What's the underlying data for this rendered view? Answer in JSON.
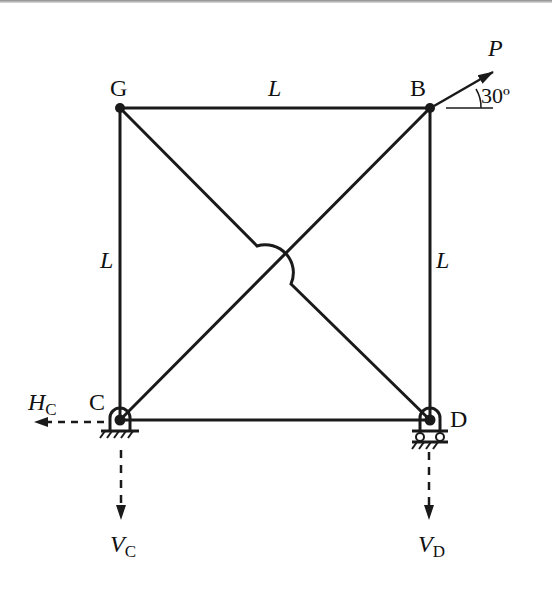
{
  "diagram": {
    "type": "truss / frame structure",
    "nodes": {
      "G": {
        "label": "G",
        "x": 120,
        "y": 108
      },
      "B": {
        "label": "B",
        "x": 430,
        "y": 108
      },
      "C": {
        "label": "C",
        "x": 120,
        "y": 420
      },
      "D": {
        "label": "D",
        "x": 430,
        "y": 420
      }
    },
    "members": [
      {
        "from": "G",
        "to": "B",
        "length_label": "L"
      },
      {
        "from": "G",
        "to": "C",
        "length_label": "L"
      },
      {
        "from": "B",
        "to": "D",
        "length_label": "L"
      },
      {
        "from": "C",
        "to": "D",
        "length_label": ""
      },
      {
        "from": "G",
        "to": "D",
        "note": "hops over diagonal CB at crossing"
      },
      {
        "from": "C",
        "to": "B"
      }
    ],
    "labels": {
      "top_length": "L",
      "left_length": "L",
      "right_length": "L",
      "node_G": "G",
      "node_B": "B",
      "node_C": "C",
      "node_D": "D"
    },
    "load": {
      "symbol": "P",
      "at": "B",
      "angle_label": "30º",
      "angle_deg": 30
    },
    "supports": {
      "C": {
        "type": "pin"
      },
      "D": {
        "type": "roller"
      }
    },
    "reactions": {
      "Hc": {
        "main": "H",
        "sub": "C",
        "direction": "left"
      },
      "Vc": {
        "main": "V",
        "sub": "C",
        "direction": "down"
      },
      "Vd": {
        "main": "V",
        "sub": "D",
        "direction": "down"
      }
    },
    "colors": {
      "line": "#1a1a1a",
      "background": "#ffffff"
    }
  }
}
